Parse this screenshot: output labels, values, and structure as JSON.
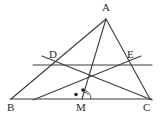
{
  "figure": {
    "type": "geometry-diagram",
    "width": 161,
    "height": 123,
    "background_color": "#ffffff",
    "stroke_color": "#3c3c3c",
    "label_color": "#2b2b2b"
  },
  "points": [
    {
      "name": "A",
      "label": "A",
      "x": 106,
      "y": 19,
      "label_x": 103,
      "label_y": 4
    },
    {
      "name": "B",
      "label": "B",
      "x": 11,
      "y": 99,
      "label_x": 8,
      "label_y": 103
    },
    {
      "name": "C",
      "label": "C",
      "x": 150,
      "y": 99,
      "label_x": 143,
      "label_y": 103
    },
    {
      "name": "D",
      "label": "D",
      "x": 53,
      "y": 65,
      "label_x": 50,
      "label_y": 50
    },
    {
      "name": "E",
      "label": "E",
      "x": 130,
      "y": 65,
      "label_x": 128,
      "label_y": 50
    },
    {
      "name": "M",
      "label": "M",
      "x": 82,
      "y": 99,
      "label_x": 77,
      "label_y": 103
    }
  ],
  "segments": [
    {
      "name": "side-AB",
      "from": "A",
      "to": "B",
      "x1": 106,
      "y1": 19,
      "x2": 11,
      "y2": 99
    },
    {
      "name": "side-AC",
      "from": "A",
      "to": "C",
      "x1": 106,
      "y1": 19,
      "x2": 150,
      "y2": 99
    },
    {
      "name": "side-BC",
      "from": "B",
      "to": "C",
      "x1": 11,
      "y1": 99,
      "x2": 152,
      "y2": 99
    },
    {
      "name": "cevian-AM",
      "from": "A",
      "to": "M",
      "x1": 106,
      "y1": 19,
      "x2": 82,
      "y2": 99
    },
    {
      "name": "midline-DE",
      "from": "D",
      "to": "E",
      "x1": 33,
      "y1": 65,
      "x2": 152,
      "y2": 65
    },
    {
      "name": "segment-DC",
      "from": "D",
      "to": "C",
      "x1": 42,
      "y1": 57,
      "x2": 152,
      "y2": 100
    },
    {
      "name": "segment-EB",
      "from": "E",
      "to": "B",
      "x1": 141,
      "y1": 57,
      "x2": 34,
      "y2": 100
    }
  ],
  "marks": [
    {
      "name": "dot-left-of-M",
      "type": "dot",
      "x": 76,
      "y": 94,
      "r": 1.7
    },
    {
      "name": "dot-above-M",
      "type": "dot",
      "x": 83,
      "y": 90,
      "r": 1.7
    },
    {
      "name": "angle-arc-AMC",
      "type": "arc",
      "cx": 82,
      "cy": 99,
      "r": 9,
      "start_deg": 0,
      "end_deg": 73
    },
    {
      "name": "angle-arc-inner",
      "type": "arc",
      "cx": 82,
      "cy": 99,
      "r": 12,
      "start_deg": 30,
      "end_deg": 73
    }
  ],
  "labels": {
    "A": "A",
    "B": "B",
    "C": "C",
    "D": "D",
    "E": "E",
    "M": "M"
  }
}
